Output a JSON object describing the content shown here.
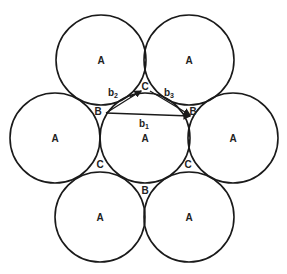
{
  "diagram": {
    "stroke": "#1a1a1a",
    "circles": [
      {
        "id": "top-left",
        "cx": 101,
        "cy": 60,
        "r": 45,
        "label": "A"
      },
      {
        "id": "top-right",
        "cx": 189,
        "cy": 60,
        "r": 45,
        "label": "A"
      },
      {
        "id": "left",
        "cx": 55,
        "cy": 138,
        "r": 45,
        "label": "A"
      },
      {
        "id": "center",
        "cx": 145,
        "cy": 138,
        "r": 45,
        "label": "A"
      },
      {
        "id": "right",
        "cx": 233,
        "cy": 138,
        "r": 45,
        "label": "A"
      },
      {
        "id": "bottom-left",
        "cx": 100,
        "cy": 217,
        "r": 45,
        "label": "A"
      },
      {
        "id": "bottom-right",
        "cx": 189,
        "cy": 217,
        "r": 45,
        "label": "A"
      }
    ],
    "interstice_labels": [
      {
        "text": "C",
        "x": 145,
        "y": 90
      },
      {
        "text": "B",
        "x": 98,
        "y": 115
      },
      {
        "text": "B",
        "x": 193,
        "y": 115
      },
      {
        "text": "C",
        "x": 100,
        "y": 168
      },
      {
        "text": "C",
        "x": 188,
        "y": 168
      },
      {
        "text": "B",
        "x": 145,
        "y": 194
      }
    ],
    "vector_labels": {
      "b1": {
        "main": "b",
        "sub": "1",
        "x": 144,
        "y": 127
      },
      "b2": {
        "main": "b",
        "sub": "2",
        "x": 113,
        "y": 96
      },
      "b3": {
        "main": "b",
        "sub": "3",
        "x": 169,
        "y": 96
      }
    }
  }
}
